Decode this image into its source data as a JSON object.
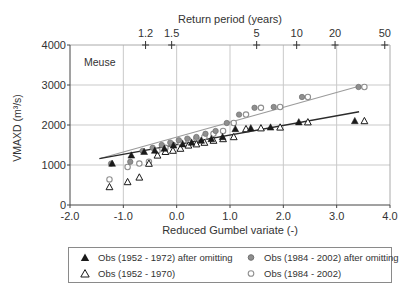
{
  "figure": {
    "station_label": "Meuse"
  },
  "chart_data": {
    "type": "scatter",
    "title": "Meuse",
    "xlabel": "Reduced Gumbel variate (-)",
    "ylabel": "VMAXD (m³/s)",
    "xlim": [
      -2.0,
      4.0
    ],
    "ylim": [
      0,
      4000
    ],
    "grid": true,
    "x_ticks": [
      {
        "label": "-2.0",
        "g": -2.0
      },
      {
        "label": "-1.0",
        "g": -1.0
      },
      {
        "label": "0.0",
        "g": 0.0
      },
      {
        "label": "1.0",
        "g": 1.0
      },
      {
        "label": "2.0",
        "g": 2.0
      },
      {
        "label": "3.0",
        "g": 3.0
      },
      {
        "label": "4.0",
        "g": 4.0
      }
    ],
    "y_ticks": [
      {
        "label": "0",
        "q": 0
      },
      {
        "label": "1000",
        "q": 1000
      },
      {
        "label": "2000",
        "q": 2000
      },
      {
        "label": "3000",
        "q": 3000
      },
      {
        "label": "4000",
        "q": 4000
      }
    ],
    "top_axis": {
      "title": "Return period (years)",
      "ticks": [
        {
          "label": "1.2",
          "g": -0.583
        },
        {
          "label": "1.5",
          "g": -0.094
        },
        {
          "label": "5",
          "g": 1.5
        },
        {
          "label": "10",
          "g": 2.25
        },
        {
          "label": "20",
          "g": 2.97
        },
        {
          "label": "50",
          "g": 3.902
        }
      ]
    },
    "series": [
      {
        "name": "Obs (1984 - 2002)",
        "marker": "circle-open",
        "color": "#8f8f8f",
        "points": [
          [
            -1.26,
            640
          ],
          [
            -0.92,
            950
          ],
          [
            -0.7,
            1035
          ],
          [
            -0.52,
            1080
          ],
          [
            -0.36,
            1350
          ],
          [
            -0.21,
            1430
          ],
          [
            -0.07,
            1500
          ],
          [
            0.07,
            1560
          ],
          [
            0.22,
            1620
          ],
          [
            0.37,
            1660
          ],
          [
            0.52,
            1700
          ],
          [
            0.69,
            1780
          ],
          [
            0.87,
            1850
          ],
          [
            1.07,
            2050
          ],
          [
            1.3,
            2260
          ],
          [
            1.58,
            2430
          ],
          [
            1.94,
            2450
          ],
          [
            2.46,
            2700
          ],
          [
            3.52,
            2950
          ]
        ]
      },
      {
        "name": "Obs (1984 - 2002) after omitting",
        "marker": "circle-filled",
        "color": "#8f8f8f",
        "points": [
          [
            -1.23,
            1035
          ],
          [
            -0.87,
            1080
          ],
          [
            -0.64,
            1350
          ],
          [
            -0.45,
            1430
          ],
          [
            -0.28,
            1500
          ],
          [
            -0.12,
            1560
          ],
          [
            0.04,
            1620
          ],
          [
            0.2,
            1660
          ],
          [
            0.37,
            1700
          ],
          [
            0.54,
            1780
          ],
          [
            0.73,
            1850
          ],
          [
            0.94,
            2050
          ],
          [
            1.17,
            2260
          ],
          [
            1.46,
            2430
          ],
          [
            1.82,
            2450
          ],
          [
            2.35,
            2700
          ],
          [
            3.41,
            2950
          ]
        ]
      },
      {
        "name": "Obs (1952 - 1970)",
        "marker": "triangle-open",
        "color": "#1a1a1a",
        "points": [
          [
            -1.26,
            450
          ],
          [
            -0.92,
            575
          ],
          [
            -0.7,
            690
          ],
          [
            -0.52,
            1035
          ],
          [
            -0.36,
            1240
          ],
          [
            -0.21,
            1330
          ],
          [
            -0.07,
            1360
          ],
          [
            0.07,
            1410
          ],
          [
            0.22,
            1490
          ],
          [
            0.37,
            1520
          ],
          [
            0.52,
            1560
          ],
          [
            0.69,
            1610
          ],
          [
            0.87,
            1650
          ],
          [
            1.07,
            1700
          ],
          [
            1.3,
            1900
          ],
          [
            1.58,
            1920
          ],
          [
            1.94,
            1940
          ],
          [
            2.46,
            2070
          ],
          [
            3.52,
            2100
          ]
        ]
      },
      {
        "name": "Obs (1952 - 1972) after omitting",
        "marker": "triangle-filled",
        "color": "#1a1a1a",
        "points": [
          [
            -1.21,
            1035
          ],
          [
            -0.85,
            1240
          ],
          [
            -0.61,
            1330
          ],
          [
            -0.41,
            1360
          ],
          [
            -0.23,
            1410
          ],
          [
            -0.06,
            1490
          ],
          [
            0.11,
            1520
          ],
          [
            0.28,
            1560
          ],
          [
            0.46,
            1610
          ],
          [
            0.65,
            1650
          ],
          [
            0.86,
            1700
          ],
          [
            1.1,
            1900
          ],
          [
            1.39,
            1920
          ],
          [
            1.76,
            1940
          ],
          [
            2.29,
            2070
          ],
          [
            3.34,
            2100
          ]
        ]
      }
    ],
    "trend_lines": [
      {
        "name": "trend-1984-2002",
        "color": "#9b9b9b",
        "width": 1.1,
        "x1": -1.42,
        "y1": 1170,
        "x2": 3.45,
        "y2": 2980
      },
      {
        "name": "trend-1952-1970",
        "color": "#2b2b2b",
        "width": 1.4,
        "x1": -1.45,
        "y1": 1160,
        "x2": 3.42,
        "y2": 2330
      }
    ],
    "colors": {
      "grid": "#c9c9c9",
      "axis": "#444444",
      "frame_light": "#aaaaaa",
      "tick": "#333333"
    }
  },
  "legend": {
    "items": [
      {
        "marker": "triangle-filled",
        "label": "Obs (1952 - 1972) after omitting"
      },
      {
        "marker": "circle-filled",
        "label": "Obs (1984 - 2002) after omitting"
      },
      {
        "marker": "triangle-open",
        "label": "Obs (1952 - 1970)"
      },
      {
        "marker": "circle-open",
        "label": "Obs (1984 - 2002)"
      }
    ]
  }
}
